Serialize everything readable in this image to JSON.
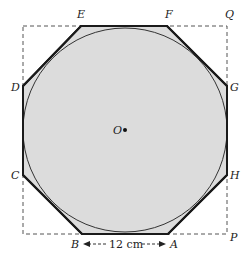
{
  "diagram": {
    "colors": {
      "fill": "#dcdcdc",
      "outline": "#1a1a1a",
      "dashed": "#555555",
      "text": "#222222"
    },
    "square": {
      "x1": 23,
      "y1": 26,
      "x2": 227,
      "y2": 234
    },
    "circle": {
      "cx": 125,
      "cy": 130,
      "r": 102
    },
    "octagon_vertices": [
      {
        "name": "E",
        "x": 81,
        "y": 26
      },
      {
        "name": "F",
        "x": 167,
        "y": 26
      },
      {
        "name": "G",
        "x": 227,
        "y": 86
      },
      {
        "name": "H",
        "x": 227,
        "y": 175
      },
      {
        "name": "A",
        "x": 168,
        "y": 234
      },
      {
        "name": "B",
        "x": 82,
        "y": 234
      },
      {
        "name": "C",
        "x": 23,
        "y": 175
      },
      {
        "name": "D",
        "x": 23,
        "y": 86
      }
    ],
    "labels": {
      "E": "E",
      "F": "F",
      "Q": "Q",
      "D": "D",
      "G": "G",
      "C": "C",
      "H": "H",
      "B": "B",
      "A": "A",
      "P": "P",
      "O": "O"
    },
    "measurement": {
      "text": "12 cm",
      "from": "B",
      "to": "A"
    },
    "center_point": {
      "name": "O",
      "x": 125,
      "y": 130
    }
  }
}
